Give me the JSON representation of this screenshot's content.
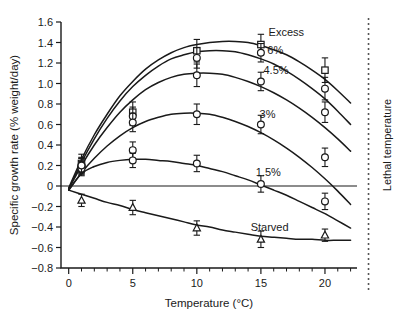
{
  "chart_data": {
    "type": "line",
    "title": "",
    "xlabel": "Temperature (°C)",
    "ylabel": "Specific growth rate (% weight/day)",
    "xlim": [
      -0.6,
      22.5
    ],
    "ylim": [
      -0.8,
      1.6
    ],
    "xticks": [
      0,
      5,
      10,
      15,
      20
    ],
    "xtick_labels": [
      "0",
      "5",
      "10",
      "15",
      "20"
    ],
    "xminor_step": 1,
    "yticks": [
      -0.8,
      -0.6,
      -0.4,
      -0.2,
      0,
      0.2,
      0.4,
      0.6,
      0.8,
      1.0,
      1.2,
      1.4,
      1.6
    ],
    "ytick_labels": [
      "−0.8",
      "−0.6",
      "−0.4",
      "−0.2",
      "0",
      "0.2",
      "0.4",
      "0.6",
      "0.8",
      "1.0",
      "1.2",
      "1.4",
      "1.6"
    ],
    "grid": false,
    "legend_position": "inline-curve-labels",
    "zero_reference_line": true,
    "annotations": [
      {
        "name": "lethal-temperature",
        "text": "Lethal temperature",
        "x": 23.4,
        "orientation": "vertical",
        "line": "dashed"
      }
    ],
    "series": [
      {
        "name": "Excess",
        "label": "Excess",
        "label_x": 15.6,
        "label_y": 1.5,
        "marker": "square",
        "x": [
          1,
          5,
          10,
          15,
          20
        ],
        "y": [
          0.22,
          0.72,
          1.32,
          1.38,
          1.13
        ],
        "yerr": [
          0.09,
          0.1,
          0.11,
          0.1,
          0.12
        ],
        "fit_points": [
          [
            0,
            -0.02
          ],
          [
            1,
            0.26
          ],
          [
            2,
            0.5
          ],
          [
            3,
            0.7
          ],
          [
            4,
            0.88
          ],
          [
            5,
            1.02
          ],
          [
            6,
            1.14
          ],
          [
            7,
            1.23
          ],
          [
            8,
            1.3
          ],
          [
            9,
            1.35
          ],
          [
            10,
            1.38
          ],
          [
            11,
            1.4
          ],
          [
            12,
            1.41
          ],
          [
            13,
            1.41
          ],
          [
            14,
            1.4
          ],
          [
            15,
            1.37
          ],
          [
            16,
            1.33
          ],
          [
            17,
            1.28
          ],
          [
            18,
            1.21
          ],
          [
            19,
            1.13
          ],
          [
            20,
            1.04
          ],
          [
            21,
            0.93
          ],
          [
            22,
            0.81
          ]
        ]
      },
      {
        "name": "6%",
        "label": "6%",
        "label_x": 15.5,
        "label_y": 1.33,
        "marker": "circle",
        "x": [
          1,
          5,
          10,
          15,
          20
        ],
        "y": [
          0.2,
          0.68,
          1.25,
          1.3,
          0.95
        ],
        "yerr": [
          0.08,
          0.09,
          0.1,
          0.09,
          0.11
        ],
        "fit_points": [
          [
            0,
            -0.03
          ],
          [
            1,
            0.23
          ],
          [
            2,
            0.46
          ],
          [
            3,
            0.66
          ],
          [
            4,
            0.83
          ],
          [
            5,
            0.97
          ],
          [
            6,
            1.08
          ],
          [
            7,
            1.17
          ],
          [
            8,
            1.24
          ],
          [
            9,
            1.28
          ],
          [
            10,
            1.31
          ],
          [
            11,
            1.32
          ],
          [
            12,
            1.32
          ],
          [
            13,
            1.31
          ],
          [
            14,
            1.28
          ],
          [
            15,
            1.24
          ],
          [
            16,
            1.19
          ],
          [
            17,
            1.12
          ],
          [
            18,
            1.04
          ],
          [
            19,
            0.95
          ],
          [
            20,
            0.85
          ],
          [
            21,
            0.73
          ],
          [
            22,
            0.6
          ]
        ]
      },
      {
        "name": "4.5%",
        "label": "4.5%",
        "label_x": 15.2,
        "label_y": 1.13,
        "marker": "circle",
        "x": [
          1,
          5,
          10,
          15,
          20
        ],
        "y": [
          0.19,
          0.62,
          1.08,
          1.02,
          0.72
        ],
        "yerr": [
          0.08,
          0.09,
          0.11,
          0.09,
          0.1
        ],
        "fit_points": [
          [
            0,
            -0.03
          ],
          [
            1,
            0.2
          ],
          [
            2,
            0.4
          ],
          [
            3,
            0.57
          ],
          [
            4,
            0.72
          ],
          [
            5,
            0.84
          ],
          [
            6,
            0.94
          ],
          [
            7,
            1.01
          ],
          [
            8,
            1.06
          ],
          [
            9,
            1.09
          ],
          [
            10,
            1.1
          ],
          [
            11,
            1.1
          ],
          [
            12,
            1.09
          ],
          [
            13,
            1.06
          ],
          [
            14,
            1.02
          ],
          [
            15,
            0.97
          ],
          [
            16,
            0.91
          ],
          [
            17,
            0.84
          ],
          [
            18,
            0.76
          ],
          [
            19,
            0.67
          ],
          [
            20,
            0.57
          ],
          [
            21,
            0.46
          ],
          [
            22,
            0.34
          ]
        ]
      },
      {
        "name": "3%",
        "label": "3%",
        "label_x": 14.9,
        "label_y": 0.7,
        "marker": "circle",
        "x": [
          1,
          5,
          10,
          15,
          20
        ],
        "y": [
          0.17,
          0.35,
          0.7,
          0.6,
          0.28
        ],
        "yerr": [
          0.07,
          0.08,
          0.1,
          0.09,
          0.09
        ],
        "fit_points": [
          [
            0,
            -0.04
          ],
          [
            1,
            0.13
          ],
          [
            2,
            0.27
          ],
          [
            3,
            0.39
          ],
          [
            4,
            0.49
          ],
          [
            5,
            0.57
          ],
          [
            6,
            0.63
          ],
          [
            7,
            0.67
          ],
          [
            8,
            0.7
          ],
          [
            9,
            0.71
          ],
          [
            10,
            0.71
          ],
          [
            11,
            0.7
          ],
          [
            12,
            0.67
          ],
          [
            13,
            0.63
          ],
          [
            14,
            0.58
          ],
          [
            15,
            0.52
          ],
          [
            16,
            0.45
          ],
          [
            17,
            0.37
          ],
          [
            18,
            0.28
          ],
          [
            19,
            0.18
          ],
          [
            20,
            0.07
          ],
          [
            21,
            -0.05
          ],
          [
            22,
            -0.18
          ]
        ]
      },
      {
        "name": "1.5%",
        "label": "1.5%",
        "label_x": 14.6,
        "label_y": 0.14,
        "marker": "circle",
        "x": [
          1,
          5,
          10,
          15,
          20
        ],
        "y": [
          0.2,
          0.25,
          0.22,
          0.02,
          -0.15
        ],
        "yerr": [
          0.07,
          0.07,
          0.08,
          0.08,
          0.08
        ],
        "fit_points": [
          [
            0,
            -0.04
          ],
          [
            1,
            0.12
          ],
          [
            2,
            0.19
          ],
          [
            3,
            0.23
          ],
          [
            4,
            0.25
          ],
          [
            5,
            0.26
          ],
          [
            6,
            0.26
          ],
          [
            7,
            0.25
          ],
          [
            8,
            0.24
          ],
          [
            9,
            0.22
          ],
          [
            10,
            0.2
          ],
          [
            11,
            0.17
          ],
          [
            12,
            0.14
          ],
          [
            13,
            0.1
          ],
          [
            14,
            0.06
          ],
          [
            15,
            0.01
          ],
          [
            16,
            -0.04
          ],
          [
            17,
            -0.09
          ],
          [
            18,
            -0.15
          ],
          [
            19,
            -0.21
          ],
          [
            20,
            -0.27
          ],
          [
            21,
            -0.34
          ],
          [
            22,
            -0.41
          ]
        ]
      },
      {
        "name": "Starved",
        "label": "Starved",
        "label_x": 14.2,
        "label_y": -0.4,
        "marker": "triangle",
        "x": [
          1,
          5,
          10,
          15,
          20
        ],
        "y": [
          -0.14,
          -0.21,
          -0.41,
          -0.52,
          -0.48
        ],
        "yerr": [
          0.06,
          0.07,
          0.07,
          0.08,
          0.06
        ],
        "fit_points": [
          [
            0,
            -0.04
          ],
          [
            1,
            -0.08
          ],
          [
            2,
            -0.12
          ],
          [
            3,
            -0.16
          ],
          [
            4,
            -0.19
          ],
          [
            5,
            -0.23
          ],
          [
            6,
            -0.26
          ],
          [
            7,
            -0.29
          ],
          [
            8,
            -0.32
          ],
          [
            9,
            -0.35
          ],
          [
            10,
            -0.38
          ],
          [
            11,
            -0.4
          ],
          [
            12,
            -0.43
          ],
          [
            13,
            -0.45
          ],
          [
            14,
            -0.47
          ],
          [
            15,
            -0.49
          ],
          [
            16,
            -0.5
          ],
          [
            17,
            -0.51
          ],
          [
            18,
            -0.52
          ],
          [
            19,
            -0.52
          ],
          [
            20,
            -0.53
          ],
          [
            21,
            -0.53
          ],
          [
            22,
            -0.53
          ]
        ]
      }
    ]
  }
}
